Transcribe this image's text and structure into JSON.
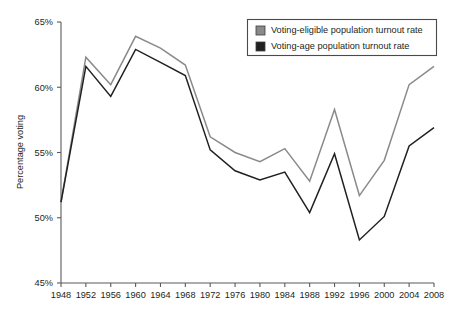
{
  "chart_data": {
    "type": "line",
    "title": "",
    "xlabel": "",
    "ylabel": "Percentage voting",
    "x": [
      1948,
      1952,
      1956,
      1960,
      1964,
      1968,
      1972,
      1976,
      1980,
      1984,
      1988,
      1992,
      1996,
      2000,
      2004,
      2008
    ],
    "xtick_labels": [
      "1948",
      "1952",
      "1956",
      "1960",
      "1964",
      "1968",
      "1972",
      "1976",
      "1980",
      "1984",
      "1988",
      "1992",
      "1996",
      "2000",
      "2004",
      "2008"
    ],
    "ytick_labels": [
      "45%",
      "50%",
      "55%",
      "60%",
      "65%"
    ],
    "ytick_values": [
      45,
      50,
      55,
      60,
      65
    ],
    "ylim": [
      45,
      65
    ],
    "xlim": [
      1948,
      2008
    ],
    "grid": false,
    "legend_position": "top-right",
    "series": [
      {
        "name": "Voting-eligible population turnout rate",
        "color": "#8a8a8a",
        "values": [
          51.2,
          62.3,
          60.2,
          63.9,
          63.0,
          61.7,
          56.2,
          55.0,
          54.3,
          55.3,
          52.8,
          58.3,
          51.7,
          54.4,
          60.2,
          61.6
        ]
      },
      {
        "name": "Voting-age population turnout rate",
        "color": "#231f20",
        "values": [
          51.2,
          61.6,
          59.3,
          62.9,
          61.9,
          60.9,
          55.2,
          53.6,
          52.9,
          53.5,
          50.4,
          54.9,
          48.3,
          50.1,
          55.5,
          56.9
        ]
      }
    ]
  },
  "legend": {
    "items": [
      {
        "label": "Voting-eligible population turnout rate",
        "swatch_color": "#8a8a8a"
      },
      {
        "label": "Voting-age population turnout rate",
        "swatch_color": "#231f20"
      }
    ]
  }
}
